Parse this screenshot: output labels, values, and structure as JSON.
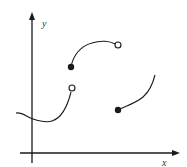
{
  "figure": {
    "type": "piecewise-function-graph",
    "axes": {
      "x_label": "x",
      "y_label": "y"
    },
    "colors": {
      "stroke": "#1a1a1a",
      "background": "#ffffff"
    },
    "pieces": [
      {
        "id": "piece-1",
        "description": "Wavy curve starting left of y-axis, dipping then rising",
        "start": {
          "x": 16,
          "y": 113,
          "endpoint": "none"
        },
        "end": {
          "x": 72,
          "y": 88,
          "endpoint": "open"
        }
      },
      {
        "id": "piece-2",
        "description": "Concave-down arc rising from closed point to open point",
        "start": {
          "x": 71,
          "y": 67,
          "endpoint": "closed"
        },
        "end": {
          "x": 118,
          "y": 45,
          "endpoint": "open"
        }
      },
      {
        "id": "piece-3",
        "description": "Increasing concave-up curve from closed point",
        "start": {
          "x": 118,
          "y": 110,
          "endpoint": "closed"
        },
        "end": {
          "x": 155,
          "y": 75,
          "endpoint": "none"
        }
      }
    ]
  }
}
